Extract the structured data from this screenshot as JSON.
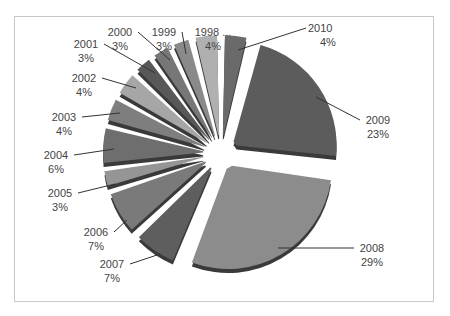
{
  "chart_data": {
    "type": "pie",
    "title": "",
    "exploded": true,
    "style": "3d-grayscale",
    "start_angle_deg": 0,
    "direction": "clockwise",
    "slices": [
      {
        "label": "2010",
        "value": 4,
        "text": "4%",
        "color": "#6a6a6a",
        "lx": 308,
        "ly": 32,
        "ax": 238,
        "ay": 50,
        "anchor": "start"
      },
      {
        "label": "2009",
        "value": 23,
        "text": "23%",
        "color": "#5c5c5c",
        "lx": 378,
        "ly": 124,
        "ax": 316,
        "ay": 97,
        "anchor": "middle"
      },
      {
        "label": "2008",
        "value": 29,
        "text": "29%",
        "color": "#8c8c8c",
        "lx": 372,
        "ly": 252,
        "ax": 278,
        "ay": 248,
        "anchor": "middle"
      },
      {
        "label": "2007",
        "value": 7,
        "text": "7%",
        "color": "#5e5e5e",
        "lx": 112,
        "ly": 268,
        "ax": 160,
        "ay": 254,
        "anchor": "middle"
      },
      {
        "label": "2006",
        "value": 7,
        "text": "7%",
        "color": "#7a7a7a",
        "lx": 96,
        "ly": 236,
        "ax": 127,
        "ay": 220,
        "anchor": "middle"
      },
      {
        "label": "2005",
        "value": 3,
        "text": "3%",
        "color": "#959595",
        "lx": 60,
        "ly": 197,
        "ax": 115,
        "ay": 184,
        "anchor": "middle"
      },
      {
        "label": "2004",
        "value": 6,
        "text": "6%",
        "color": "#6e6e6e",
        "lx": 56,
        "ly": 159,
        "ax": 114,
        "ay": 149,
        "anchor": "middle"
      },
      {
        "label": "2003",
        "value": 4,
        "text": "4%",
        "color": "#7e7e7e",
        "lx": 64,
        "ly": 121,
        "ax": 120,
        "ay": 113,
        "anchor": "middle"
      },
      {
        "label": "2002",
        "value": 4,
        "text": "4%",
        "color": "#a6a6a6",
        "lx": 84,
        "ly": 82,
        "ax": 136,
        "ay": 88,
        "anchor": "middle"
      },
      {
        "label": "2001",
        "value": 3,
        "text": "3%",
        "color": "#585858",
        "lx": 86,
        "ly": 48,
        "ax": 155,
        "ay": 73,
        "anchor": "middle"
      },
      {
        "label": "2000",
        "value": 3,
        "text": "3%",
        "color": "#777777",
        "lx": 120,
        "ly": 36,
        "ax": 170,
        "ay": 60,
        "anchor": "middle"
      },
      {
        "label": "1999",
        "value": 3,
        "text": "3%",
        "color": "#8a8a8a",
        "lx": 164,
        "ly": 36,
        "ax": 186,
        "ay": 54,
        "anchor": "middle"
      },
      {
        "label": "1998 ...",
        "value": 4,
        "text": "4%",
        "color": "#b0b0b0",
        "lx": 213,
        "ly": 36,
        "ax": 0,
        "ay": 0,
        "anchor": "middle"
      }
    ],
    "center": {
      "x": 221,
      "y": 153
    },
    "radius": 104,
    "legend": "none"
  }
}
